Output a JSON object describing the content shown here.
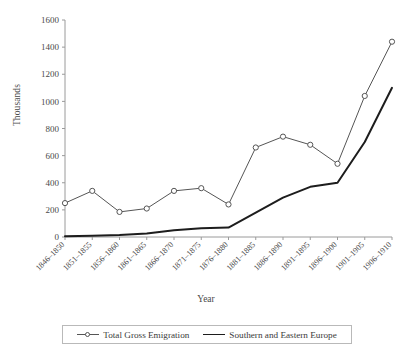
{
  "chart_data": {
    "type": "line",
    "title": "",
    "xlabel": "Year",
    "ylabel": "Thousands",
    "ylim": [
      0,
      1600
    ],
    "ytick_values": [
      0,
      200,
      400,
      600,
      800,
      1000,
      1200,
      1400,
      1600
    ],
    "ytick_labels": [
      "0",
      "200",
      "400",
      "600",
      "800",
      "1000",
      "1200",
      "1400",
      "1600"
    ],
    "grid": false,
    "legend_position": "bottom",
    "categories": [
      "1846–1850",
      "1851–1855",
      "1856–1860",
      "1861–1865",
      "1866–1870",
      "1871–1875",
      "1876–1880",
      "1881–1885",
      "1886–1890",
      "1891–1895",
      "1896–1900",
      "1901–1905",
      "1906–1910"
    ],
    "series": [
      {
        "name": "Total Gross Emigration",
        "marker": "open-circle",
        "color": "#555555",
        "linewidth": 1,
        "values": [
          250,
          340,
          185,
          210,
          340,
          360,
          240,
          660,
          740,
          680,
          540,
          1040,
          1440
        ]
      },
      {
        "name": "Southern and Eastern Europe",
        "marker": "none",
        "color": "#1d1d1d",
        "linewidth": 2,
        "values": [
          5,
          10,
          15,
          25,
          50,
          65,
          70,
          180,
          290,
          370,
          400,
          700,
          1100
        ]
      }
    ]
  },
  "legend": {
    "entries": [
      {
        "label": "Total Gross Emigration"
      },
      {
        "label": "Southern and Eastern Europe"
      }
    ]
  },
  "axes": {
    "y_title": "Thousands",
    "x_title": "Year"
  }
}
